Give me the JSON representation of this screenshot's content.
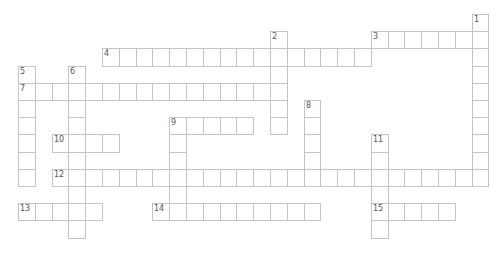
{
  "puzzle": {
    "grid": {
      "cols": 28,
      "rows": 13,
      "origin_x": 18,
      "origin_y": 14,
      "cell_w": 16.8,
      "cell_h": 17.2
    },
    "colors": {
      "border": "#c4c4c4",
      "cell_bg": "#ffffff",
      "number": "#555555"
    },
    "entries": [
      {
        "number": "1",
        "direction": "down",
        "row": 0,
        "col": 27,
        "length": 10
      },
      {
        "number": "2",
        "direction": "down",
        "row": 1,
        "col": 15,
        "length": 6
      },
      {
        "number": "3",
        "direction": "across",
        "row": 1,
        "col": 21,
        "length": 7
      },
      {
        "number": "4",
        "direction": "across",
        "row": 2,
        "col": 5,
        "length": 16
      },
      {
        "number": "5",
        "direction": "down",
        "row": 3,
        "col": 0,
        "length": 7
      },
      {
        "number": "6",
        "direction": "down",
        "row": 3,
        "col": 3,
        "length": 10
      },
      {
        "number": "7",
        "direction": "across",
        "row": 4,
        "col": 0,
        "length": 16
      },
      {
        "number": "8",
        "direction": "down",
        "row": 5,
        "col": 17,
        "length": 5
      },
      {
        "number": "9",
        "direction": "across",
        "row": 6,
        "col": 9,
        "length": 5
      },
      {
        "number": "9",
        "direction": "down",
        "row": 6,
        "col": 9,
        "length": 6
      },
      {
        "number": "10",
        "direction": "across",
        "row": 7,
        "col": 2,
        "length": 4
      },
      {
        "number": "11",
        "direction": "down",
        "row": 7,
        "col": 21,
        "length": 6
      },
      {
        "number": "12",
        "direction": "across",
        "row": 9,
        "col": 2,
        "length": 26
      },
      {
        "number": "13",
        "direction": "across",
        "row": 11,
        "col": 0,
        "length": 5
      },
      {
        "number": "14",
        "direction": "across",
        "row": 11,
        "col": 8,
        "length": 10
      },
      {
        "number": "15",
        "direction": "across",
        "row": 11,
        "col": 21,
        "length": 5
      }
    ]
  }
}
